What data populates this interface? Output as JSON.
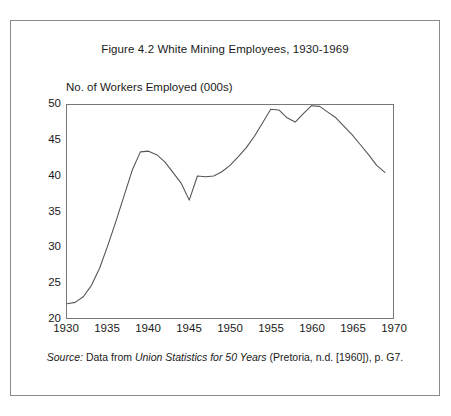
{
  "figure": {
    "title": "Figure 4.2 White Mining Employees, 1930-1969",
    "y_axis_title": "No. of Workers Employed (000s)",
    "source_prefix": "Source:",
    "source_lead": " Data from ",
    "source_italic_title": "Union Statistics for 50 Years",
    "source_tail": " (Pretoria, n.d. [1960]), p. G7.",
    "line_color": "#555555",
    "frame_color": "#777777",
    "outer_border_color": "#8a8a8a"
  },
  "chart_data": {
    "type": "line",
    "title": "Figure 4.2 White Mining Employees, 1930-1969",
    "xlabel": "",
    "ylabel": "No. of Workers Employed (000s)",
    "xlim": [
      1930,
      1970
    ],
    "ylim": [
      20,
      50
    ],
    "xticks": [
      1930,
      1935,
      1940,
      1945,
      1950,
      1955,
      1960,
      1965,
      1970
    ],
    "yticks": [
      20,
      25,
      30,
      35,
      40,
      45,
      50
    ],
    "grid": false,
    "legend": null,
    "series": [
      {
        "name": "White mining employees (000s)",
        "x": [
          1930,
          1931,
          1932,
          1933,
          1934,
          1935,
          1936,
          1937,
          1938,
          1939,
          1940,
          1941,
          1942,
          1943,
          1944,
          1945,
          1946,
          1947,
          1948,
          1949,
          1950,
          1951,
          1952,
          1953,
          1954,
          1955,
          1956,
          1957,
          1958,
          1959,
          1960,
          1961,
          1962,
          1963,
          1964,
          1965,
          1966,
          1967,
          1968,
          1969
        ],
        "values": [
          22.0,
          22.2,
          23.0,
          24.6,
          27.0,
          30.2,
          33.6,
          37.2,
          40.8,
          43.4,
          43.5,
          43.0,
          42.0,
          40.5,
          39.0,
          36.6,
          40.0,
          39.9,
          40.0,
          40.6,
          41.5,
          42.7,
          44.0,
          45.6,
          47.5,
          49.4,
          49.3,
          48.2,
          47.6,
          48.8,
          49.9,
          49.8,
          49.0,
          48.2,
          47.0,
          45.8,
          44.4,
          43.0,
          41.5,
          40.5
        ]
      }
    ]
  }
}
